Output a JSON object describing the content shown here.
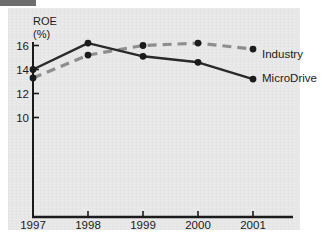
{
  "chart_data": {
    "type": "line",
    "title": "",
    "xlabel": "",
    "ylabel": "ROE",
    "ylabel_unit": "(%)",
    "categories": [
      "1997",
      "1998",
      "1999",
      "2000",
      "2001"
    ],
    "x": [
      1997,
      1998,
      1999,
      2000,
      2001
    ],
    "ylim": [
      9.0,
      17.0
    ],
    "yticks": [
      10,
      12,
      14,
      16
    ],
    "ytick_labels": [
      "10",
      "12",
      "14",
      "16"
    ],
    "grid": false,
    "legend_position": "right-inline-end-labels",
    "series": [
      {
        "name": "MicroDrive",
        "style": "solid",
        "color": "#2a2a2a",
        "marker": "circle",
        "values": [
          14.0,
          16.2,
          15.1,
          14.6,
          13.2
        ]
      },
      {
        "name": "Industry",
        "style": "dashed",
        "color": "#8e8e8e",
        "marker": "circle",
        "values": [
          13.3,
          15.2,
          16.0,
          16.2,
          15.7
        ]
      }
    ],
    "annotations": [
      {
        "text": "Industry",
        "near_series": "Industry",
        "at_category": "2001"
      },
      {
        "text": "MicroDrive",
        "near_series": "MicroDrive",
        "at_category": "2001"
      }
    ]
  },
  "axes": {
    "y_axis_title_line1": "ROE",
    "y_axis_title_line2": "(%)"
  },
  "colors": {
    "background": "#ffffff",
    "panel": "#e9e9e9",
    "axis": "#1b1b1b",
    "series_solid": "#2a2a2a",
    "series_dashed": "#8e8e8e",
    "text": "#1b1b1b"
  }
}
